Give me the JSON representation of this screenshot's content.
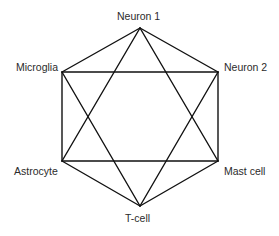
{
  "diagram": {
    "type": "network-graph",
    "shape": "hexagon with inscribed hexagram",
    "nodes": [
      {
        "id": "neuron1",
        "label": "Neuron 1",
        "x": 140,
        "y": 28
      },
      {
        "id": "neuron2",
        "label": "Neuron 2",
        "x": 218,
        "y": 72
      },
      {
        "id": "mastcell",
        "label": "Mast cell",
        "x": 218,
        "y": 161
      },
      {
        "id": "tcell",
        "label": "T-cell",
        "x": 140,
        "y": 206
      },
      {
        "id": "astrocyte",
        "label": "Astrocyte",
        "x": 62,
        "y": 161
      },
      {
        "id": "microglia",
        "label": "Microglia",
        "x": 62,
        "y": 72
      }
    ],
    "edges": [
      [
        "neuron1",
        "neuron2"
      ],
      [
        "neuron2",
        "mastcell"
      ],
      [
        "mastcell",
        "tcell"
      ],
      [
        "tcell",
        "astrocyte"
      ],
      [
        "astrocyte",
        "microglia"
      ],
      [
        "microglia",
        "neuron1"
      ],
      [
        "neuron1",
        "astrocyte"
      ],
      [
        "neuron1",
        "mastcell"
      ],
      [
        "astrocyte",
        "mastcell"
      ],
      [
        "tcell",
        "microglia"
      ],
      [
        "tcell",
        "neuron2"
      ],
      [
        "microglia",
        "neuron2"
      ]
    ],
    "labels": {
      "neuron1": "Neuron 1",
      "neuron2": "Neuron 2",
      "mastcell": "Mast cell",
      "tcell": "T-cell",
      "astrocyte": "Astrocyte",
      "microglia": "Microglia"
    }
  }
}
